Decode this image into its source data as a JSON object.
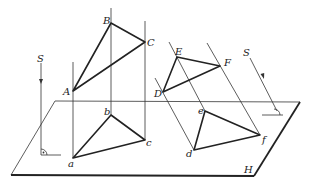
{
  "diagram": {
    "labels": {
      "plane": "H",
      "direction_left": "S",
      "direction_right": "S",
      "A": "A",
      "B": "B",
      "C": "C",
      "a": "a",
      "b": "b",
      "c": "c",
      "D": "D",
      "E": "E",
      "F": "F",
      "d": "d",
      "e": "e",
      "f": "f"
    },
    "points": {
      "A": [
        73,
        91
      ],
      "B": [
        111,
        23
      ],
      "C": [
        145,
        42
      ],
      "a": [
        73,
        158
      ],
      "b": [
        111,
        115
      ],
      "c": [
        145,
        140
      ],
      "D": [
        163,
        92
      ],
      "E": [
        177,
        57
      ],
      "F": [
        220,
        66
      ],
      "d": [
        194,
        150
      ],
      "e": [
        205,
        111
      ],
      "f": [
        260,
        135
      ]
    },
    "plane_corners": [
      [
        55,
        101
      ],
      [
        300,
        102
      ],
      [
        254,
        176
      ],
      [
        11,
        175
      ]
    ],
    "projections": [
      {
        "name": "orthogonal",
        "source": "ABC",
        "image": "abc"
      },
      {
        "name": "oblique",
        "source": "DEF",
        "image": "def"
      }
    ]
  }
}
